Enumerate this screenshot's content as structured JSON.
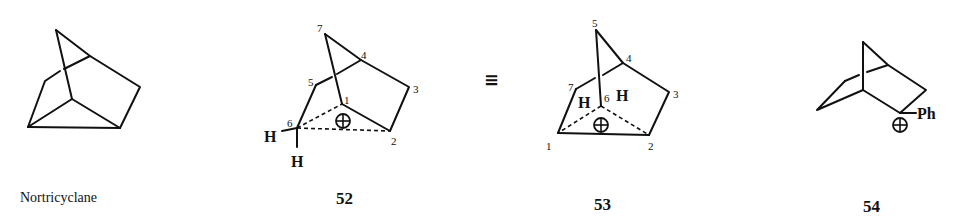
{
  "figure": {
    "structures": [
      {
        "id": "nortricyclane",
        "caption": "Nortricyclane",
        "atom_labels": []
      },
      {
        "id": "52",
        "caption": "52",
        "atom_labels": [
          "1",
          "2",
          "3",
          "4",
          "5",
          "6",
          "7"
        ],
        "hydrogens": [
          "H",
          "H"
        ],
        "charge": "⊕"
      },
      {
        "id": "53",
        "caption": "53",
        "atom_labels": [
          "1",
          "2",
          "3",
          "4",
          "5",
          "6",
          "7"
        ],
        "hydrogens": [
          "H",
          "H"
        ],
        "charge": "⊕"
      },
      {
        "id": "54",
        "caption": "54",
        "substituent": "Ph",
        "charge": "⊕"
      }
    ],
    "equivalence_symbol": "≡"
  }
}
